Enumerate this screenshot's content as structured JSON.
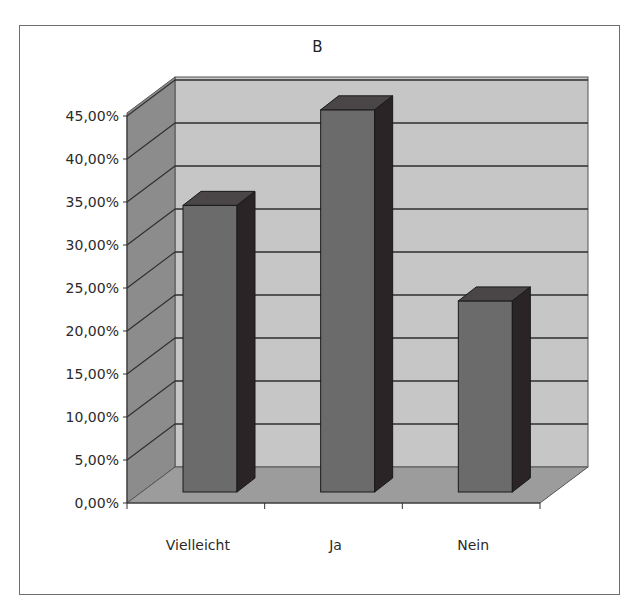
{
  "chart_data": {
    "type": "bar",
    "style": "3d-column",
    "title": "B",
    "xlabel": "",
    "ylabel": "",
    "categories": [
      "Vielleicht",
      "Ja",
      "Nein"
    ],
    "values": [
      33.33,
      44.44,
      22.22
    ],
    "value_format": "percent",
    "yticks": [
      "0,00%",
      "5,00%",
      "10,00%",
      "15,00%",
      "20,00%",
      "25,00%",
      "30,00%",
      "35,00%",
      "40,00%",
      "45,00%"
    ],
    "ylim": [
      0,
      45
    ],
    "grid": true,
    "legend": null
  },
  "colors": {
    "back_wall": "#c6c6c6",
    "side_wall": "#8c8c8c",
    "floor": "#9c9c9c",
    "bar_front": "#6b6b6b",
    "bar_top": "#4a4547",
    "bar_side": "#2b2427",
    "gridline": "#2e2e2e"
  }
}
